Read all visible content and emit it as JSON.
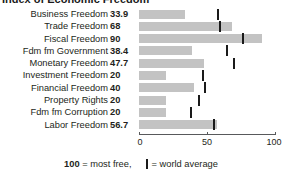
{
  "title": "Index of Economic Freedom",
  "axis": {
    "ticks": [
      "0",
      "50",
      "100"
    ],
    "tick_values": [
      0,
      50,
      100
    ],
    "min": 0,
    "max": 100
  },
  "legend": {
    "bold": "100",
    "most_free": " = most free,",
    "world_average": "= world average",
    "mark_name": "world-average-mark"
  },
  "colors": {
    "bar": "#c3c3c3",
    "mark": "#1a1a1a",
    "text": "#231f20",
    "axis": "#58595b",
    "background": "#ffffff"
  },
  "chart_data": {
    "type": "bar",
    "orientation": "horizontal",
    "title": "Index of Economic Freedom",
    "xlabel": "",
    "ylabel": "",
    "xlim": [
      0,
      100
    ],
    "grid": false,
    "legend_position": "bottom",
    "categories": [
      "Business Freedom",
      "Trade Freedom",
      "Fiscal Freedom",
      "Fdm fm Government",
      "Monetary Freedom",
      "Investment Freedom",
      "Financial Freedom",
      "Property Rights",
      "Fdm fm Corruption",
      "Labor Freedom"
    ],
    "values": [
      33.9,
      68,
      90,
      38.4,
      47.7,
      20,
      40,
      20,
      20,
      56.7
    ],
    "value_labels": [
      "33.9",
      "68",
      "90",
      "38.4",
      "47.7",
      "20",
      "40",
      "20",
      "20",
      "56.7"
    ],
    "world_average": [
      57.5,
      58.9,
      76.0,
      64.0,
      69.5,
      47.0,
      48.0,
      44.0,
      38.0,
      55.0
    ],
    "series": [
      {
        "name": "Country score",
        "values": [
          33.9,
          68,
          90,
          38.4,
          47.7,
          20,
          40,
          20,
          20,
          56.7
        ]
      },
      {
        "name": "World average",
        "values": [
          57.5,
          58.9,
          76.0,
          64.0,
          69.5,
          47.0,
          48.0,
          44.0,
          38.0,
          55.0
        ]
      }
    ]
  }
}
